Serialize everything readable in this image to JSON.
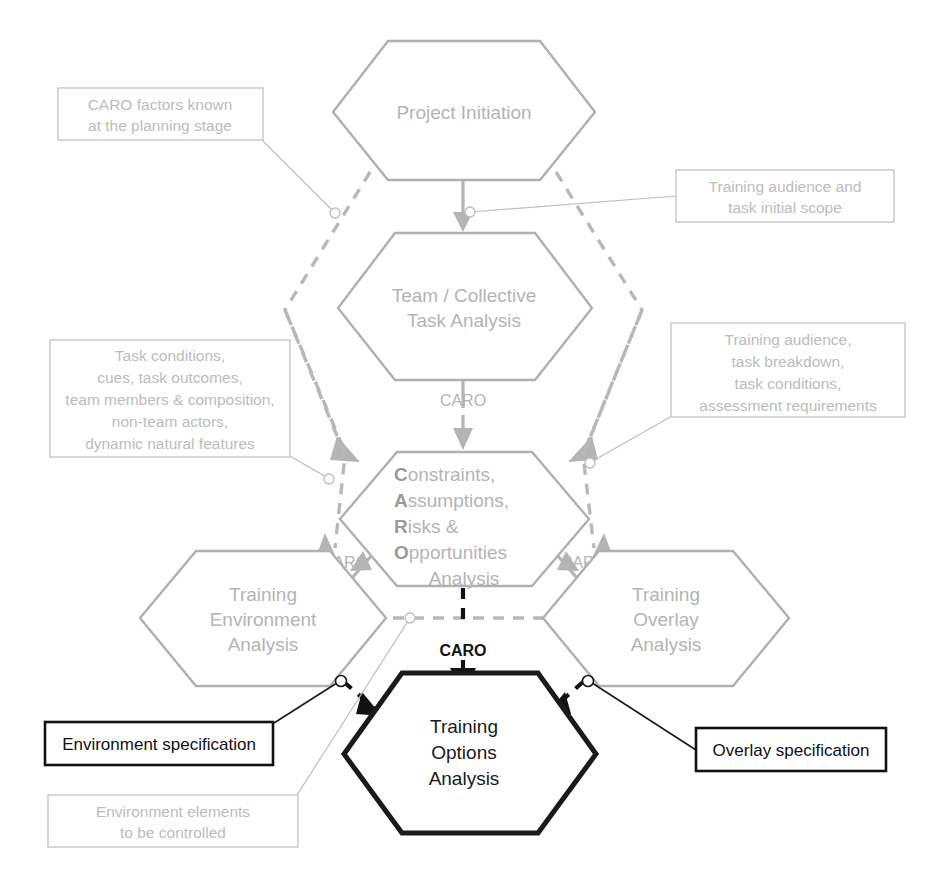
{
  "diagram": {
    "type": "flowchart",
    "colors": {
      "gray_node": "#b4b4b4",
      "black_node": "#111111",
      "callout_border": "#c6c6c6",
      "callout_text": "#bcbcbc"
    },
    "nodes": [
      {
        "id": "project-initiation",
        "shape": "hexagon",
        "emphasis": "gray",
        "lines": [
          "Project Initiation"
        ]
      },
      {
        "id": "team-collective-task-analysis",
        "shape": "hexagon",
        "emphasis": "gray",
        "lines": [
          "Team / Collective",
          "Task Analysis"
        ]
      },
      {
        "id": "caro-analysis",
        "shape": "hexagon",
        "emphasis": "gray",
        "lines": [
          "Constraints,",
          "Assumptions,",
          "Risks &",
          "Opportunities",
          "Analysis"
        ],
        "initials": [
          "C",
          "A",
          "R",
          "O"
        ],
        "rest": [
          "onstraints,",
          "ssumptions,",
          "isks &",
          "pportunities"
        ],
        "last_line": "Analysis"
      },
      {
        "id": "training-environment-analysis",
        "shape": "hexagon",
        "emphasis": "gray",
        "lines": [
          "Training",
          "Environment",
          "Analysis"
        ]
      },
      {
        "id": "training-overlay-analysis",
        "shape": "hexagon",
        "emphasis": "gray",
        "lines": [
          "Training",
          "Overlay",
          "Analysis"
        ]
      },
      {
        "id": "training-options-analysis",
        "shape": "hexagon",
        "emphasis": "black",
        "lines": [
          "Training",
          "Options",
          "Analysis"
        ]
      }
    ],
    "edge_labels": [
      {
        "id": "caro-top",
        "text": "CARO",
        "emphasis": "gray"
      },
      {
        "id": "caro-left",
        "text": "CARO",
        "emphasis": "gray"
      },
      {
        "id": "caro-right",
        "text": "CARO",
        "emphasis": "gray"
      },
      {
        "id": "caro-center",
        "text": "CARO",
        "emphasis": "black"
      }
    ],
    "callouts": [
      {
        "id": "caro-factors-known",
        "emphasis": "gray",
        "lines": [
          "CARO factors known",
          "at the planning stage"
        ]
      },
      {
        "id": "training-audience-initial-scope",
        "emphasis": "gray",
        "lines": [
          "Training audience and",
          "task initial scope"
        ]
      },
      {
        "id": "task-conditions-cues",
        "emphasis": "gray",
        "lines": [
          "Task conditions,",
          "cues, task outcomes,",
          "team members & composition,",
          "non-team actors,",
          "dynamic natural features"
        ]
      },
      {
        "id": "training-audience-task-breakdown",
        "emphasis": "gray",
        "lines": [
          "Training audience,",
          "task breakdown,",
          "task conditions,",
          "assessment requirements"
        ]
      },
      {
        "id": "environment-elements-controlled",
        "emphasis": "gray",
        "lines": [
          "Environment elements",
          "to be controlled"
        ]
      }
    ],
    "specs": [
      {
        "id": "environment-specification",
        "emphasis": "black",
        "lines": [
          "Environment specification"
        ]
      },
      {
        "id": "overlay-specification",
        "emphasis": "black",
        "lines": [
          "Overlay specification"
        ]
      }
    ]
  }
}
